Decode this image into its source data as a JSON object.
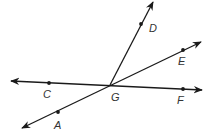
{
  "diagram": {
    "type": "geometry-lines-and-rays",
    "colors": {
      "stroke": "#1a1a1a",
      "label": "#333333",
      "background": "#ffffff"
    },
    "intersection": {
      "label": "G",
      "x": 110,
      "y": 85
    },
    "points": [
      {
        "id": "D",
        "label": "D",
        "x": 141,
        "y": 24,
        "label_x": 149,
        "label_y": 32
      },
      {
        "id": "E",
        "label": "E",
        "x": 183,
        "y": 50,
        "label_x": 178,
        "label_y": 65
      },
      {
        "id": "C",
        "label": "C",
        "x": 49,
        "y": 83,
        "label_x": 43,
        "label_y": 98
      },
      {
        "id": "F",
        "label": "F",
        "x": 183,
        "y": 89,
        "label_x": 177,
        "label_y": 104
      },
      {
        "id": "A",
        "label": "A",
        "x": 58,
        "y": 112,
        "label_x": 54,
        "label_y": 129
      },
      {
        "id": "G",
        "label": "G",
        "x": 110,
        "y": 85,
        "label_x": 111,
        "label_y": 101
      }
    ],
    "lines": [
      {
        "id": "line-CF",
        "name": "line CF",
        "x1": 11,
        "y1": 81,
        "x2": 202,
        "y2": 90,
        "arrows": "both"
      },
      {
        "id": "line-AE",
        "name": "line AE",
        "x1": 22,
        "y1": 128,
        "x2": 201,
        "y2": 42,
        "arrows": "both"
      },
      {
        "id": "ray-GD",
        "name": "ray GD",
        "x1": 110,
        "y1": 85,
        "x2": 153,
        "y2": 2,
        "arrows": "end"
      }
    ]
  }
}
